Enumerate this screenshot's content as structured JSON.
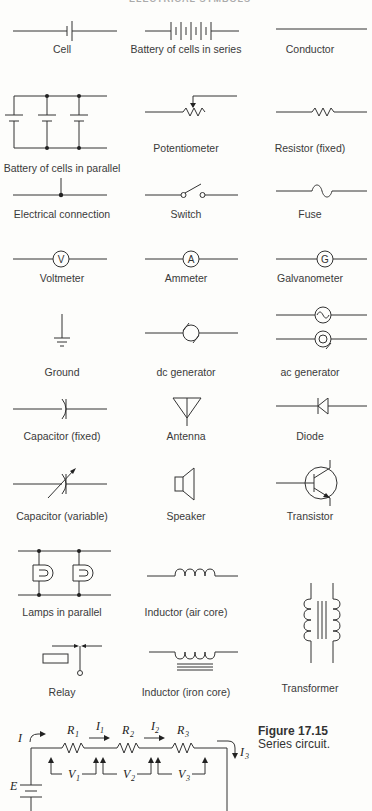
{
  "header": {
    "title": "ELECTRICAL SYMBOLS"
  },
  "symbols": [
    {
      "id": "cell",
      "label": "Cell"
    },
    {
      "id": "battery-series",
      "label": "Battery of cells in series"
    },
    {
      "id": "conductor",
      "label": "Conductor"
    },
    {
      "id": "battery-parallel",
      "label": "Battery of cells in parallel"
    },
    {
      "id": "potentiometer",
      "label": "Potentiometer"
    },
    {
      "id": "resistor",
      "label": "Resistor (fixed)"
    },
    {
      "id": "electrical-connection",
      "label": "Electrical connection"
    },
    {
      "id": "switch",
      "label": "Switch"
    },
    {
      "id": "fuse",
      "label": "Fuse"
    },
    {
      "id": "voltmeter",
      "label": "Voltmeter",
      "glyph": "V"
    },
    {
      "id": "ammeter",
      "label": "Ammeter",
      "glyph": "A"
    },
    {
      "id": "galvanometer",
      "label": "Galvanometer",
      "glyph": "G"
    },
    {
      "id": "ground",
      "label": "Ground"
    },
    {
      "id": "dc-generator",
      "label": "dc generator"
    },
    {
      "id": "ac-generator",
      "label": "ac generator"
    },
    {
      "id": "capacitor-fixed",
      "label": "Capacitor (fixed)"
    },
    {
      "id": "antenna",
      "label": "Antenna"
    },
    {
      "id": "diode",
      "label": "Diode"
    },
    {
      "id": "capacitor-variable",
      "label": "Capacitor (variable)"
    },
    {
      "id": "speaker",
      "label": "Speaker"
    },
    {
      "id": "transistor",
      "label": "Transistor"
    },
    {
      "id": "lamps-parallel",
      "label": "Lamps in parallel"
    },
    {
      "id": "inductor-air",
      "label": "Inductor (air core)"
    },
    {
      "id": "transformer",
      "label": "Transformer"
    },
    {
      "id": "relay",
      "label": "Relay"
    },
    {
      "id": "inductor-iron",
      "label": "Inductor (iron core)"
    }
  ],
  "figure": {
    "number": "Figure 17.15",
    "caption": "Series circuit.",
    "labels": {
      "I": "I",
      "E": "E",
      "R1": "R",
      "R1_sub": "1",
      "R2": "R",
      "R2_sub": "2",
      "R3": "R",
      "R3_sub": "3",
      "I1": "I",
      "I1_sub": "1",
      "I2": "I",
      "I2_sub": "2",
      "I3": "I",
      "I3_sub": "3",
      "V1": "V",
      "V1_sub": "1",
      "V2": "V",
      "V2_sub": "2",
      "V3": "V",
      "V3_sub": "3"
    }
  }
}
